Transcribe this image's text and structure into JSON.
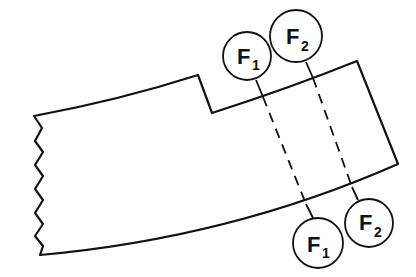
{
  "diagram": {
    "markers_top": [
      {
        "id": "F1-top",
        "letter": "F",
        "subscript": "1"
      },
      {
        "id": "F2-top",
        "letter": "F",
        "subscript": "2"
      }
    ],
    "markers_bottom": [
      {
        "id": "F1-bottom",
        "letter": "F",
        "subscript": "1"
      },
      {
        "id": "F2-bottom",
        "letter": "F",
        "subscript": "2"
      }
    ],
    "colors": {
      "line": "#111111",
      "background": "#ffffff"
    }
  }
}
